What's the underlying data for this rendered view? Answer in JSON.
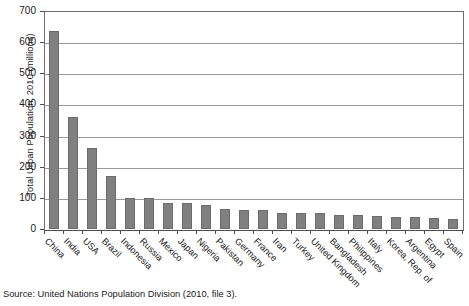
{
  "figure": {
    "source_note": "Source: United Nations Population Division (2010, file 3)."
  },
  "chart_data": {
    "type": "bar",
    "title": "",
    "xlabel": "",
    "ylabel": "Total Urban Population, 2010 (millions)",
    "ylim": [
      0,
      700
    ],
    "ytick_step": 100,
    "yticks": [
      0,
      100,
      200,
      300,
      400,
      500,
      600,
      700
    ],
    "ytick_labels": [
      "0",
      "100",
      "200",
      "300",
      "400",
      "500",
      "600",
      "700"
    ],
    "grid": true,
    "grid_axis": "y",
    "legend": "none",
    "bar_color": "#808080",
    "bar_edge_color": "#6b6b6b",
    "categories": [
      "China",
      "India",
      "USA",
      "Brazil",
      "Indonesia",
      "Russia",
      "Mexico",
      "Japan",
      "Nigeria",
      "Pakistan",
      "Germany",
      "France",
      "Iran",
      "Turkey",
      "United Kingdom",
      "Bangladesh",
      "Philippines",
      "Italy",
      "Korea, Rep. of",
      "Argentina",
      "Egypt",
      "Spain"
    ],
    "values": [
      636,
      361,
      259,
      169,
      101,
      101,
      85,
      84,
      78,
      65,
      61,
      60,
      52,
      51,
      50,
      45,
      45,
      42,
      40,
      38,
      34,
      32
    ]
  }
}
